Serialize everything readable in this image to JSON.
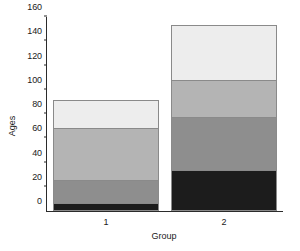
{
  "chart_data": {
    "type": "bar",
    "subtype": "stacked-bar",
    "title": "",
    "xlabel": "Group",
    "ylabel": "Ages",
    "categories": [
      "1",
      "2"
    ],
    "ylim": [
      0,
      160
    ],
    "yticks": [
      0,
      20,
      40,
      60,
      80,
      100,
      120,
      140,
      160
    ],
    "ytick_labels": [
      "0",
      "20",
      "40",
      "60",
      "80",
      "100",
      "120",
      "140",
      "160"
    ],
    "grid": false,
    "legend": "none",
    "series": [
      {
        "name": "segment-1",
        "color": "#1c1c1c",
        "values": [
          7,
          34
        ]
      },
      {
        "name": "segment-2",
        "color": "#8e8e8e",
        "values": [
          19,
          44
        ]
      },
      {
        "name": "segment-3",
        "color": "#b4b4b4",
        "values": [
          44,
          32
        ]
      },
      {
        "name": "segment-4",
        "color": "#ededed",
        "values": [
          24,
          46
        ]
      }
    ],
    "totals": [
      94,
      156
    ],
    "bar_geometry": {
      "bar_width_pct": 45,
      "bar_centers_pct": [
        25,
        75
      ]
    },
    "axis_color": "#2b2b2b",
    "segment_border_color": "#8a8a8a",
    "background": "#ffffff"
  }
}
